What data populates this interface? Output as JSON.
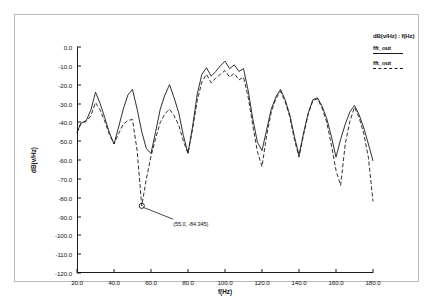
{
  "chart_data": {
    "type": "line",
    "title": "",
    "xlabel": "f(Hz)",
    "ylabel": "dB(v/Hz)",
    "xlim": [
      20.0,
      180.0
    ],
    "ylim": [
      -120.0,
      0.0
    ],
    "grid": false,
    "legend_position": "right",
    "legend_title": "dB(v/Hz)   :  f(Hz)",
    "xticks": [
      "20.0",
      "40.0",
      "60.0",
      "80.0",
      "100.0",
      "120.0",
      "140.0",
      "160.0",
      "180.0"
    ],
    "xtick_values": [
      20,
      40,
      60,
      80,
      100,
      120,
      140,
      160,
      180
    ],
    "yticks": [
      "0.0",
      "-10.0",
      "-20.0",
      "-30.0",
      "-40.0",
      "-50.0",
      "-60.0",
      "-70.0",
      "-80.0",
      "-90.0",
      "-100.0",
      "-110.0",
      "-120.0"
    ],
    "ytick_values": [
      0,
      -10,
      -20,
      -30,
      -40,
      -50,
      -60,
      -70,
      -80,
      -90,
      -100,
      -110,
      -120
    ],
    "series": [
      {
        "name": "fft_out",
        "style": "solid",
        "color": "#1a1a1a",
        "x": [
          20,
          22,
          25,
          27.5,
          30,
          32.5,
          35,
          37.5,
          40,
          42.5,
          45,
          47.5,
          50,
          52.5,
          55,
          57.5,
          60,
          62.5,
          65,
          67.5,
          70,
          72.5,
          75,
          77.5,
          80,
          82.5,
          85,
          87.5,
          90,
          92.5,
          95,
          97.5,
          100,
          102.5,
          105,
          107.5,
          110,
          112.5,
          115,
          117.5,
          120,
          122.5,
          125,
          127.5,
          130,
          132.5,
          135,
          137.5,
          140,
          142.5,
          145,
          147.5,
          150,
          152.5,
          155,
          157.5,
          160,
          162.5,
          165,
          167.5,
          170,
          172.5,
          175,
          177.5,
          180
        ],
        "y": [
          -45.5,
          -40.5,
          -39.0,
          -33.5,
          -24.0,
          -30.0,
          -37.5,
          -45.5,
          -51.5,
          -42.5,
          -33.0,
          -25.5,
          -22.5,
          -33.0,
          -45.0,
          -54.0,
          -56.5,
          -45.0,
          -33.0,
          -25.5,
          -20.0,
          -27.0,
          -35.0,
          -47.0,
          -56.5,
          -42.0,
          -25.0,
          -14.5,
          -11.0,
          -15.5,
          -13.0,
          -10.0,
          -7.5,
          -11.5,
          -9.5,
          -13.0,
          -11.5,
          -23.0,
          -38.0,
          -50.5,
          -55.0,
          -44.0,
          -33.0,
          -26.5,
          -22.5,
          -28.0,
          -36.0,
          -47.5,
          -57.5,
          -45.5,
          -35.0,
          -28.0,
          -27.0,
          -31.5,
          -38.0,
          -47.5,
          -58.5,
          -49.0,
          -41.0,
          -34.5,
          -31.0,
          -36.0,
          -43.0,
          -51.5,
          -60.5
        ]
      },
      {
        "name": "fft_out",
        "style": "dashed",
        "color": "#1a1a1a",
        "x": [
          20,
          22,
          25,
          27.5,
          30,
          32.5,
          35,
          37.5,
          40,
          42.5,
          45,
          47.5,
          50,
          52.5,
          55,
          57.5,
          60,
          62.5,
          65,
          67.5,
          70,
          72.5,
          75,
          77.5,
          80,
          82.5,
          85,
          87.5,
          90,
          92.5,
          95,
          97.5,
          100,
          102.5,
          105,
          107.5,
          110,
          112.5,
          115,
          117.5,
          120,
          122.5,
          125,
          127.5,
          130,
          132.5,
          135,
          137.5,
          140,
          142.5,
          145,
          147.5,
          150,
          152.5,
          155,
          157.5,
          160,
          162.5,
          165,
          167.5,
          170,
          172.5,
          175,
          177.5,
          180
        ],
        "y": [
          -45.5,
          -41.0,
          -39.5,
          -36.5,
          -29.5,
          -33.5,
          -39.5,
          -46.5,
          -51.5,
          -46.0,
          -41.0,
          -39.0,
          -38.5,
          -55.0,
          -84.3,
          -70.0,
          -58.0,
          -48.5,
          -40.0,
          -35.5,
          -33.0,
          -36.5,
          -41.5,
          -50.0,
          -56.5,
          -43.5,
          -28.5,
          -18.5,
          -14.5,
          -19.0,
          -16.5,
          -14.5,
          -12.5,
          -16.0,
          -14.0,
          -17.5,
          -16.0,
          -26.5,
          -41.5,
          -55.5,
          -63.5,
          -47.0,
          -34.5,
          -27.5,
          -23.5,
          -29.0,
          -37.0,
          -49.0,
          -58.5,
          -46.5,
          -35.5,
          -28.5,
          -27.5,
          -32.5,
          -40.0,
          -52.0,
          -65.5,
          -73.5,
          -51.5,
          -39.5,
          -32.0,
          -37.5,
          -46.0,
          -58.5,
          -82.0
        ]
      }
    ],
    "annotations": [
      {
        "name": "marker",
        "label": "(55.0, -84.345)",
        "x": 55.0,
        "y": -84.345,
        "marker": "circle",
        "label_x": 72.0,
        "label_y": -92.5
      }
    ]
  },
  "legend": {
    "title": "dB(v/Hz)   :  f(Hz)",
    "entries": [
      {
        "label": "fft_out",
        "style": "solid"
      },
      {
        "label": "fft_out",
        "style": "dashed"
      }
    ]
  }
}
